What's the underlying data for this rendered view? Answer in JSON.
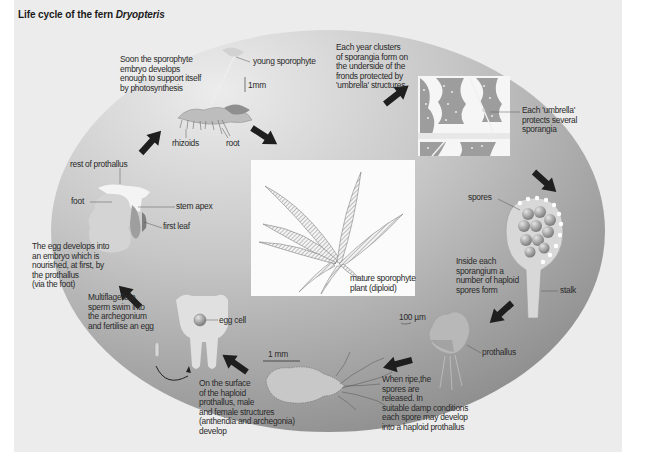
{
  "title": {
    "prefix": "Life cycle of the fern ",
    "species": "Dryopteris"
  },
  "colors": {
    "ellipse_light": "#e6e6e6",
    "ellipse_dark": "#8c8c8c",
    "arrow": "#1e1e1e",
    "text": "#2a2a2a"
  },
  "labels": {
    "sporophyte_support": "Soon the sporophyte\nembryo develops\nenough to support itself\nby photosynthesis",
    "young_sporophyte": "young sporophyte",
    "scale_1mm_top": "1mm",
    "rhizoids": "rhizoids",
    "root": "root",
    "sporangia_clusters": "Each year clusters\nof sporangia form on\nthe underside of the\nfronds protected by\n'umbrella' structures",
    "umbrella": "Each 'umbrella'\nprotects several\nsporangia",
    "spores": "spores",
    "inside_sporangium": "Inside each\nsporangium a\nnumber of haploid\nspores form",
    "stalk": "stalk",
    "scale_100um": "100 µm",
    "prothallus": "prothallus",
    "spores_released": "When ripe,the\nspores are\nreleased. In\nsuitable damp conditions\neach spore may develop\ninto a haploid prothallus",
    "scale_1mm_bottom": "1 mm",
    "haploid_surface": "On the surface\nof the haploid\nprothallus, male\nand female structures\n(antheridia and archegonia)\ndevelop",
    "egg_cell": "egg cell",
    "sperm_swim": "Multiflagellate\nsperm swim into\nthe archegonium\nand fertilise an egg",
    "egg_develops": "The egg develops into\nan embryo which is\nnourished, at first, by\nthe prothallus\n(via the foot)",
    "rest_of_prothallus": "rest of prothallus",
    "foot": "foot",
    "stem_apex": "stem apex",
    "first_leaf": "first leaf",
    "mature_sporophyte": "mature sporophyte\nplant (diploid)"
  },
  "stages": [
    "young sporophyte",
    "sporangia on frond underside",
    "sporangium with spores",
    "prothallus",
    "haploid prothallus with antheridia and archegonia",
    "archegonium with egg cell",
    "embryo nourished by prothallus",
    "mature sporophyte plant (diploid)"
  ]
}
